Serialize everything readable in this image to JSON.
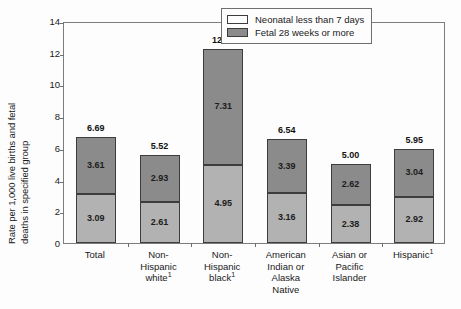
{
  "chart_data": {
    "type": "bar",
    "stacked": true,
    "title": "",
    "subtitle": "",
    "xlabel": "",
    "ylabel": "Rate per 1,000 live births and fetal deaths in specified group",
    "ylabel_lines": [
      "Rate per 1,000 live births and fetal",
      "deaths in specified group"
    ],
    "ylim": [
      0,
      14
    ],
    "yticks": [
      0,
      2,
      4,
      6,
      8,
      10,
      12,
      14
    ],
    "ytick_labels": [
      "0",
      "2",
      "4",
      "6",
      "8",
      "10",
      "12",
      "14"
    ],
    "grid": false,
    "legend_position": "top-right",
    "categories": [
      "Total",
      "Non-Hispanic white",
      "Non-Hispanic black",
      "American Indian or Alaska Native",
      "Asian or Pacific Islander",
      "Hispanic"
    ],
    "category_label_lines": [
      [
        "Total"
      ],
      [
        "Non-",
        "Hispanic",
        "white¹"
      ],
      [
        "Non-",
        "Hispanic",
        "black¹"
      ],
      [
        "American",
        "Indian or",
        "Alaska",
        "Native"
      ],
      [
        "Asian or",
        "Pacific",
        "Islander"
      ],
      [
        "Hispanic¹"
      ]
    ],
    "series": [
      {
        "name": "Fetal 28 weeks or more",
        "color": "#b2b2b2",
        "values": [
          3.09,
          2.61,
          4.95,
          3.16,
          2.38,
          2.92
        ],
        "value_labels": [
          "3.09",
          "2.61",
          "4.95",
          "3.16",
          "2.38",
          "2.92"
        ]
      },
      {
        "name": "Neonatal less than 7 days",
        "color": "#8b8b8b",
        "values": [
          3.61,
          2.93,
          7.31,
          3.39,
          2.62,
          3.04
        ],
        "value_labels": [
          "3.61",
          "2.93",
          "7.31",
          "3.39",
          "2.62",
          "3.04"
        ]
      }
    ],
    "totals": [
      6.69,
      5.52,
      12.22,
      6.54,
      5.0,
      5.95
    ],
    "total_labels": [
      "6.69",
      "5.52",
      "12.22",
      "6.54",
      "5.00",
      "5.95"
    ]
  },
  "legend": {
    "items": [
      {
        "label": "Neonatal less than 7 days",
        "swatch": "white",
        "swatch_color": "#fdfdfd"
      },
      {
        "label": "Fetal 28 weeks or more",
        "swatch": "gray",
        "swatch_color": "#8b8b8b"
      }
    ]
  },
  "colors": {
    "background": "#fdfdfd",
    "axis": "#7d7d7d",
    "bar_lower": "#b2b2b2",
    "bar_upper": "#8b8b8b",
    "bar_outline": "#3d3d3d",
    "text": "#1a1a1a"
  }
}
